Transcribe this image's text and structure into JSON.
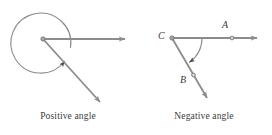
{
  "figure": {
    "background_color": "#ffffff",
    "stroke_color": "#8c8c8c",
    "text_color": "#3c3c3c",
    "width": 272,
    "height": 135,
    "panels": [
      {
        "id": "positive-angle",
        "caption": "Positive angle",
        "vertex": {
          "x": 43,
          "y": 39
        },
        "rotation_direction": "counterclockwise",
        "arc": {
          "center": {
            "x": 43,
            "y": 40
          },
          "radius": 30,
          "sweep_label": "nearly full turn",
          "arrow_at": "end"
        },
        "rays": [
          {
            "name": "initial-side-ray",
            "from": {
              "x": 43,
              "y": 39
            },
            "to": {
              "x": 130,
              "y": 39
            },
            "arrow": true
          },
          {
            "name": "terminal-side-ray",
            "from": {
              "x": 43,
              "y": 39
            },
            "to": {
              "x": 105,
              "y": 108
            },
            "arrow": true
          }
        ],
        "points": [
          {
            "label": "",
            "x": 43,
            "y": 39
          }
        ]
      },
      {
        "id": "negative-angle",
        "caption": "Negative angle",
        "vertex": {
          "x": 172,
          "y": 38
        },
        "rotation_direction": "clockwise",
        "arc": {
          "center": {
            "x": 172,
            "y": 38
          },
          "radius": 30,
          "sweep_label": "about one fifth turn",
          "arrow_at": "end"
        },
        "rays": [
          {
            "name": "ray-CA",
            "from": {
              "x": 172,
              "y": 38
            },
            "to": {
              "x": 262,
              "y": 38
            },
            "arrow": true
          },
          {
            "name": "ray-CB",
            "from": {
              "x": 172,
              "y": 38
            },
            "to": {
              "x": 212,
              "y": 104
            },
            "arrow": true
          }
        ],
        "points": [
          {
            "label": "C",
            "x": 172,
            "y": 38
          },
          {
            "label": "A",
            "x": 232,
            "y": 38
          },
          {
            "label": "B",
            "x": 194,
            "y": 74
          }
        ]
      }
    ],
    "labels": {
      "A": "A",
      "B": "B",
      "C": "C"
    }
  }
}
